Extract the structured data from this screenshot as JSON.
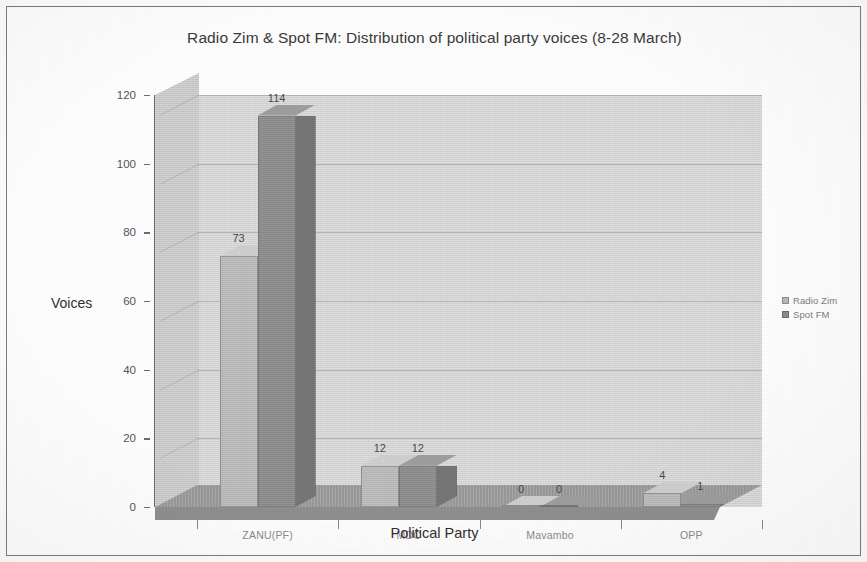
{
  "chart_data": {
    "type": "bar",
    "title": "Radio Zim & Spot FM: Distribution of political party voices (8-28 March)",
    "xlabel": "Political Party",
    "ylabel": "Voices",
    "categories": [
      "ZANU(PF)",
      "MDC",
      "Mavambo",
      "OPP"
    ],
    "series": [
      {
        "name": "Radio Zim",
        "values": [
          73,
          12,
          0,
          4
        ],
        "color": "#b9b9b9"
      },
      {
        "name": "Spot FM",
        "values": [
          114,
          12,
          0,
          1
        ],
        "color": "#8b8b8b"
      }
    ],
    "ylim": [
      0,
      120
    ],
    "yticks": [
      0,
      20,
      40,
      60,
      80,
      100,
      120
    ],
    "ytick_labels": [
      "0",
      "20",
      "40",
      "60",
      "80",
      "100",
      "120"
    ],
    "grid": true,
    "legend_position": "right",
    "style": "3d-column",
    "data_labels": [
      "73",
      "114",
      "12",
      "12",
      "0",
      "0",
      "4",
      "1"
    ]
  },
  "legend": {
    "entries": [
      {
        "label": "Radio Zim"
      },
      {
        "label": "Spot FM"
      }
    ]
  }
}
